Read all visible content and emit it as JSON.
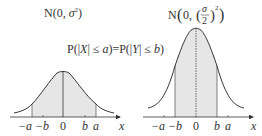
{
  "left_graph": {
    "title": "N(0, σ²)",
    "title_parts": {
      "prefix": "N(0, ",
      "sigma": "σ",
      "exp": "2",
      "suffix": ")"
    },
    "ticks": {
      "neg_a": "−a",
      "neg_b": "−b",
      "zero": "0",
      "b": "b",
      "a": "a"
    },
    "axis_label": "x",
    "shaded_between": [
      "−a",
      "a"
    ]
  },
  "right_graph": {
    "title_parts": {
      "prefix": "N",
      "open": "(",
      "zero": "0, ",
      "sigma": "σ",
      "two": "2",
      "exp": "2",
      "close": ")"
    },
    "ticks": {
      "neg_a": "−a",
      "neg_b": "−b",
      "zero": "0",
      "b": "b",
      "a": "a"
    },
    "axis_label": "x",
    "shaded_between": [
      "−b",
      "b"
    ]
  },
  "equation": {
    "text": "P(|X| ≤ a) = P(|Y| ≤ b)",
    "left": "P(|",
    "X": "X",
    "mid1": "| ≤ ",
    "a": "a",
    "eq": ")=P(|",
    "Y": "Y",
    "mid2": "| ≤ ",
    "b": "b",
    "end": ")"
  },
  "colors": {
    "curve": "#333333",
    "fill": "#e6e6e6",
    "text": "#333333"
  }
}
